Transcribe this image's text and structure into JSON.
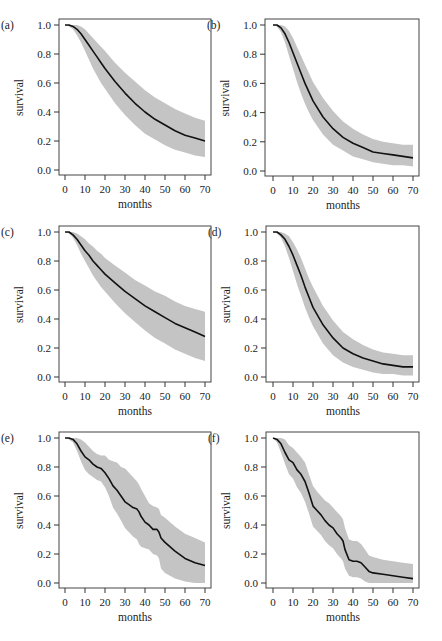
{
  "figure": {
    "layout": {
      "rows": 3,
      "cols": 2
    },
    "shared_axes": {
      "xlabel": "months",
      "ylabel": "survival",
      "xticks": [
        0,
        10,
        20,
        30,
        40,
        50,
        60,
        70
      ],
      "yticks": [
        "0.0",
        "0.2",
        "0.4",
        "0.6",
        "0.8",
        "1.0"
      ],
      "xlim": [
        0,
        70
      ],
      "ylim": [
        0,
        1
      ]
    },
    "colors": {
      "band": "#c4c4c4",
      "curve": "#111111",
      "frame": "#444444"
    }
  },
  "chart_data": [
    {
      "panel": "(a)",
      "type": "line",
      "title": "",
      "xlabel": "months",
      "ylabel": "survival",
      "xlim": [
        0,
        70
      ],
      "ylim": [
        0,
        1
      ],
      "grid": false,
      "legend": null,
      "x": [
        0,
        2,
        4,
        6,
        8,
        10,
        12,
        14,
        16,
        18,
        20,
        25,
        30,
        35,
        40,
        45,
        50,
        55,
        60,
        65,
        70
      ],
      "series": [
        {
          "name": "survival",
          "values": [
            1.0,
            1.0,
            0.99,
            0.97,
            0.94,
            0.9,
            0.86,
            0.82,
            0.78,
            0.74,
            0.7,
            0.61,
            0.53,
            0.46,
            0.4,
            0.35,
            0.31,
            0.27,
            0.24,
            0.22,
            0.2
          ]
        },
        {
          "name": "upper",
          "values": [
            1.0,
            1.0,
            1.0,
            1.0,
            0.99,
            0.97,
            0.94,
            0.91,
            0.88,
            0.85,
            0.82,
            0.74,
            0.67,
            0.61,
            0.55,
            0.5,
            0.46,
            0.42,
            0.39,
            0.36,
            0.34
          ]
        },
        {
          "name": "lower",
          "values": [
            1.0,
            0.99,
            0.97,
            0.93,
            0.88,
            0.82,
            0.76,
            0.7,
            0.65,
            0.6,
            0.56,
            0.46,
            0.38,
            0.31,
            0.25,
            0.21,
            0.17,
            0.14,
            0.12,
            0.1,
            0.09
          ]
        }
      ]
    },
    {
      "panel": "(b)",
      "type": "line",
      "title": "",
      "xlabel": "months",
      "ylabel": "survival",
      "xlim": [
        0,
        70
      ],
      "ylim": [
        0,
        1
      ],
      "grid": false,
      "legend": null,
      "x": [
        0,
        2,
        4,
        6,
        8,
        10,
        12,
        14,
        16,
        18,
        20,
        25,
        30,
        35,
        40,
        45,
        50,
        55,
        60,
        65,
        70
      ],
      "series": [
        {
          "name": "survival",
          "values": [
            1.0,
            1.0,
            0.98,
            0.94,
            0.88,
            0.81,
            0.74,
            0.67,
            0.6,
            0.54,
            0.48,
            0.37,
            0.29,
            0.23,
            0.19,
            0.16,
            0.13,
            0.12,
            0.11,
            0.1,
            0.09
          ]
        },
        {
          "name": "upper",
          "values": [
            1.0,
            1.0,
            1.0,
            0.99,
            0.96,
            0.91,
            0.85,
            0.79,
            0.73,
            0.67,
            0.61,
            0.5,
            0.41,
            0.34,
            0.29,
            0.25,
            0.22,
            0.2,
            0.19,
            0.18,
            0.18
          ]
        },
        {
          "name": "lower",
          "values": [
            1.0,
            0.99,
            0.95,
            0.88,
            0.79,
            0.7,
            0.61,
            0.53,
            0.46,
            0.4,
            0.35,
            0.25,
            0.18,
            0.14,
            0.1,
            0.08,
            0.06,
            0.05,
            0.04,
            0.04,
            0.03
          ]
        }
      ]
    },
    {
      "panel": "(c)",
      "type": "line",
      "title": "",
      "xlabel": "months",
      "ylabel": "survival",
      "xlim": [
        0,
        70
      ],
      "ylim": [
        0,
        1
      ],
      "grid": false,
      "legend": null,
      "x": [
        0,
        2,
        4,
        6,
        8,
        10,
        12,
        14,
        16,
        18,
        20,
        25,
        30,
        35,
        40,
        45,
        50,
        55,
        60,
        65,
        70
      ],
      "series": [
        {
          "name": "survival",
          "values": [
            1.0,
            1.0,
            0.98,
            0.95,
            0.91,
            0.87,
            0.84,
            0.8,
            0.77,
            0.74,
            0.71,
            0.65,
            0.59,
            0.54,
            0.49,
            0.45,
            0.41,
            0.37,
            0.34,
            0.31,
            0.28
          ]
        },
        {
          "name": "upper",
          "values": [
            1.0,
            1.0,
            1.0,
            0.99,
            0.97,
            0.95,
            0.92,
            0.9,
            0.87,
            0.85,
            0.82,
            0.77,
            0.72,
            0.67,
            0.63,
            0.59,
            0.56,
            0.52,
            0.49,
            0.47,
            0.45
          ]
        },
        {
          "name": "lower",
          "values": [
            1.0,
            0.99,
            0.96,
            0.91,
            0.85,
            0.8,
            0.75,
            0.7,
            0.66,
            0.62,
            0.59,
            0.51,
            0.44,
            0.38,
            0.32,
            0.27,
            0.23,
            0.19,
            0.16,
            0.13,
            0.11
          ]
        }
      ]
    },
    {
      "panel": "(d)",
      "type": "line",
      "title": "",
      "xlabel": "months",
      "ylabel": "survival",
      "xlim": [
        0,
        70
      ],
      "ylim": [
        0,
        1
      ],
      "grid": false,
      "legend": null,
      "x": [
        0,
        2,
        4,
        6,
        8,
        10,
        12,
        14,
        16,
        18,
        20,
        25,
        30,
        35,
        40,
        45,
        50,
        55,
        60,
        65,
        70
      ],
      "series": [
        {
          "name": "survival",
          "values": [
            1.0,
            1.0,
            0.98,
            0.95,
            0.9,
            0.84,
            0.77,
            0.7,
            0.62,
            0.55,
            0.48,
            0.36,
            0.27,
            0.2,
            0.16,
            0.13,
            0.11,
            0.09,
            0.08,
            0.07,
            0.07
          ]
        },
        {
          "name": "upper",
          "values": [
            1.0,
            1.0,
            1.0,
            0.99,
            0.97,
            0.93,
            0.88,
            0.82,
            0.75,
            0.68,
            0.62,
            0.49,
            0.39,
            0.31,
            0.26,
            0.22,
            0.19,
            0.17,
            0.16,
            0.15,
            0.15
          ]
        },
        {
          "name": "lower",
          "values": [
            1.0,
            0.99,
            0.96,
            0.9,
            0.82,
            0.73,
            0.64,
            0.56,
            0.48,
            0.41,
            0.35,
            0.23,
            0.15,
            0.1,
            0.07,
            0.05,
            0.03,
            0.02,
            0.02,
            0.01,
            0.01
          ]
        }
      ]
    },
    {
      "panel": "(e)",
      "type": "line",
      "title": "",
      "xlabel": "months",
      "ylabel": "survival",
      "xlim": [
        0,
        70
      ],
      "ylim": [
        0,
        1
      ],
      "grid": false,
      "legend": null,
      "x": [
        0,
        2,
        4,
        6,
        8,
        10,
        12,
        14,
        16,
        18,
        20,
        22,
        24,
        26,
        28,
        30,
        32,
        34,
        36,
        37,
        38,
        40,
        42,
        44,
        46,
        47,
        48,
        50,
        55,
        60,
        65,
        70
      ],
      "series": [
        {
          "name": "survival",
          "values": [
            1.0,
            1.0,
            0.99,
            0.96,
            0.91,
            0.87,
            0.85,
            0.82,
            0.8,
            0.79,
            0.76,
            0.72,
            0.67,
            0.64,
            0.6,
            0.56,
            0.54,
            0.52,
            0.51,
            0.49,
            0.46,
            0.42,
            0.4,
            0.37,
            0.37,
            0.35,
            0.31,
            0.28,
            0.22,
            0.17,
            0.14,
            0.12
          ]
        },
        {
          "name": "upper",
          "values": [
            1.0,
            1.0,
            1.0,
            1.0,
            0.99,
            0.97,
            0.94,
            0.91,
            0.89,
            0.88,
            0.88,
            0.85,
            0.84,
            0.83,
            0.8,
            0.79,
            0.76,
            0.73,
            0.7,
            0.68,
            0.65,
            0.6,
            0.55,
            0.53,
            0.52,
            0.51,
            0.47,
            0.45,
            0.39,
            0.34,
            0.31,
            0.28
          ]
        },
        {
          "name": "lower",
          "values": [
            1.0,
            0.99,
            0.97,
            0.91,
            0.84,
            0.78,
            0.75,
            0.73,
            0.71,
            0.7,
            0.66,
            0.6,
            0.52,
            0.48,
            0.43,
            0.38,
            0.35,
            0.32,
            0.3,
            0.27,
            0.25,
            0.24,
            0.23,
            0.2,
            0.19,
            0.17,
            0.1,
            0.07,
            0.03,
            0.01,
            0.0,
            0.0
          ]
        }
      ]
    },
    {
      "panel": "(f)",
      "type": "line",
      "title": "",
      "xlabel": "months",
      "ylabel": "survival",
      "xlim": [
        0,
        70
      ],
      "ylim": [
        0,
        1
      ],
      "grid": false,
      "legend": null,
      "x": [
        0,
        2,
        4,
        6,
        8,
        10,
        12,
        14,
        16,
        18,
        20,
        22,
        24,
        26,
        28,
        30,
        32,
        34,
        35,
        36,
        38,
        40,
        42,
        44,
        46,
        48,
        50,
        55,
        60,
        65,
        70
      ],
      "series": [
        {
          "name": "survival",
          "values": [
            1.0,
            0.99,
            0.96,
            0.9,
            0.85,
            0.83,
            0.78,
            0.75,
            0.7,
            0.62,
            0.53,
            0.5,
            0.47,
            0.43,
            0.4,
            0.38,
            0.34,
            0.31,
            0.29,
            0.23,
            0.16,
            0.15,
            0.15,
            0.14,
            0.11,
            0.08,
            0.07,
            0.06,
            0.05,
            0.04,
            0.03
          ]
        },
        {
          "name": "upper",
          "values": [
            1.0,
            1.0,
            1.0,
            0.99,
            0.95,
            0.93,
            0.9,
            0.87,
            0.83,
            0.75,
            0.67,
            0.63,
            0.6,
            0.57,
            0.55,
            0.52,
            0.49,
            0.46,
            0.44,
            0.38,
            0.3,
            0.29,
            0.29,
            0.27,
            0.23,
            0.19,
            0.18,
            0.16,
            0.15,
            0.14,
            0.13
          ]
        },
        {
          "name": "lower",
          "values": [
            1.0,
            0.97,
            0.9,
            0.82,
            0.75,
            0.72,
            0.66,
            0.62,
            0.56,
            0.48,
            0.39,
            0.36,
            0.33,
            0.29,
            0.26,
            0.24,
            0.2,
            0.17,
            0.15,
            0.1,
            0.05,
            0.04,
            0.04,
            0.03,
            0.01,
            0.0,
            0.0,
            0.0,
            0.0,
            0.0,
            0.0
          ]
        }
      ]
    }
  ],
  "geometry": [
    {
      "ox": 59,
      "oy": 19,
      "fw": 152,
      "fh": 156,
      "x0": 65,
      "x70": 205,
      "y1": 25,
      "y0": 170
    },
    {
      "ox": 265,
      "oy": 19,
      "fw": 154,
      "fh": 157,
      "x0": 273,
      "x70": 413,
      "y1": 25,
      "y0": 171
    },
    {
      "ox": 59,
      "oy": 226,
      "fw": 152,
      "fh": 156,
      "x0": 65,
      "x70": 205,
      "y1": 232,
      "y0": 377
    },
    {
      "ox": 266,
      "oy": 226,
      "fw": 153,
      "fh": 156,
      "x0": 273,
      "x70": 413,
      "y1": 232,
      "y0": 377
    },
    {
      "ox": 59,
      "oy": 432,
      "fw": 152,
      "fh": 156,
      "x0": 65,
      "x70": 205,
      "y1": 438,
      "y0": 583
    },
    {
      "ox": 266,
      "oy": 432,
      "fw": 153,
      "fh": 156,
      "x0": 273,
      "x70": 413,
      "y1": 438,
      "y0": 583
    }
  ]
}
